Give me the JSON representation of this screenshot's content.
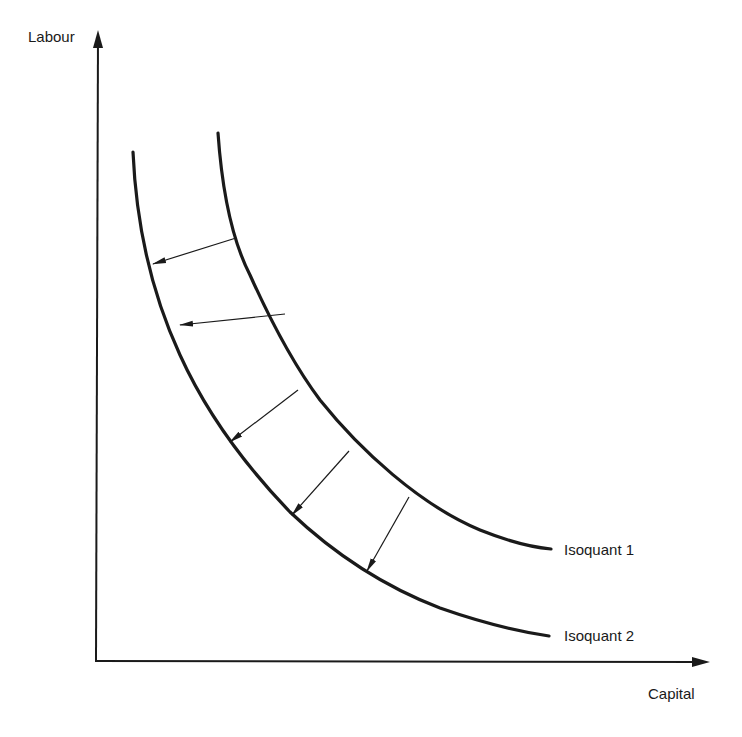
{
  "diagram": {
    "type": "isoquant-shift",
    "axes": {
      "y_label": "Labour",
      "x_label": "Capital"
    },
    "curves": [
      {
        "name": "Isoquant 1",
        "label": "Isoquant 1",
        "position": "outer"
      },
      {
        "name": "Isoquant 2",
        "label": "Isoquant 2",
        "position": "inner"
      }
    ],
    "arrows": {
      "count": 5,
      "direction": "from Isoquant 1 toward Isoquant 2 (inward shift toward origin)"
    },
    "colors": {
      "line": "#1a1a1a",
      "background": "#ffffff"
    }
  }
}
